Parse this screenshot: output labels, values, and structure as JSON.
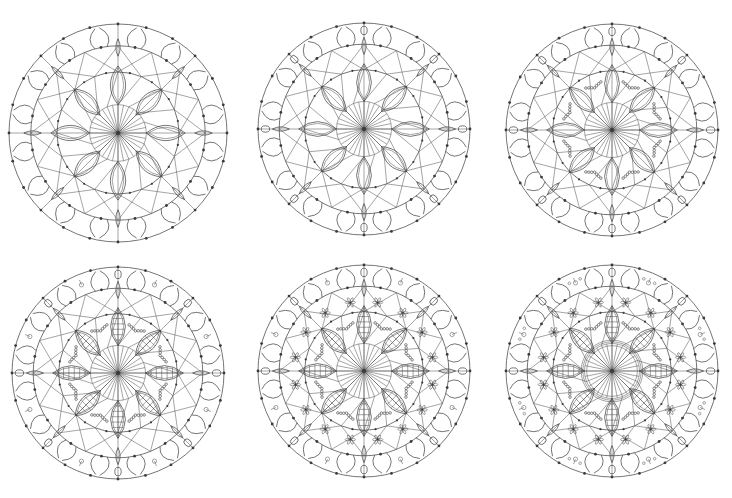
{
  "page": {
    "title_fragment": "",
    "background": "#ffffff",
    "stroke_color": "#3a3a3a"
  },
  "mandalas": [
    {
      "id": "mandala-1",
      "cx": 118,
      "cy": 133,
      "r": 109,
      "stage": 1,
      "rings": [
        0.8,
        0.56,
        0.26
      ],
      "petals": 8,
      "dots_outer": 24,
      "flowers": 0,
      "leaf_veins": false,
      "beads": false,
      "inner_ring": false,
      "motifs": false,
      "tulip_drops": false
    },
    {
      "id": "mandala-2",
      "cx": 364,
      "cy": 129,
      "r": 106,
      "stage": 2,
      "rings": [
        0.8,
        0.56,
        0.26
      ],
      "petals": 8,
      "dots_outer": 24,
      "flowers": 0,
      "leaf_veins": false,
      "beads": false,
      "inner_ring": false,
      "motifs": false,
      "tulip_drops": true
    },
    {
      "id": "mandala-3",
      "cx": 612,
      "cy": 130,
      "r": 106,
      "stage": 3,
      "rings": [
        0.8,
        0.56,
        0.26
      ],
      "petals": 8,
      "dots_outer": 24,
      "flowers": 0,
      "leaf_veins": false,
      "beads": true,
      "inner_ring": false,
      "motifs": false,
      "tulip_drops": true
    },
    {
      "id": "mandala-4",
      "cx": 118,
      "cy": 373,
      "r": 106,
      "stage": 4,
      "rings": [
        0.8,
        0.56,
        0.26
      ],
      "petals": 8,
      "dots_outer": 24,
      "flowers": 0,
      "leaf_veins": true,
      "beads": true,
      "inner_ring": false,
      "motifs": true,
      "tulip_drops": true
    },
    {
      "id": "mandala-5",
      "cx": 364,
      "cy": 371,
      "r": 106,
      "stage": 5,
      "rings": [
        0.8,
        0.56,
        0.26
      ],
      "petals": 8,
      "dots_outer": 24,
      "flowers": 16,
      "leaf_veins": true,
      "beads": true,
      "inner_ring": false,
      "motifs": true,
      "tulip_drops": true
    },
    {
      "id": "mandala-6",
      "cx": 612,
      "cy": 371,
      "r": 106,
      "stage": 6,
      "rings": [
        0.8,
        0.56,
        0.26
      ],
      "petals": 8,
      "dots_outer": 24,
      "flowers": 16,
      "leaf_veins": true,
      "beads": true,
      "inner_ring": true,
      "motifs": true,
      "tulip_drops": true
    }
  ]
}
